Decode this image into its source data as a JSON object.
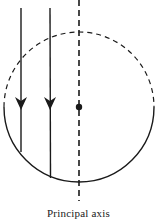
{
  "diagram": {
    "title": "",
    "labels": {
      "principal_axis": "Principal axis"
    },
    "elements": {
      "sphere": {
        "type": "circle",
        "upper_half_style": "dashed",
        "lower_half_style": "solid"
      },
      "incident_rays": [
        {
          "id": "ray-1",
          "direction": "down",
          "arrowhead": true
        },
        {
          "id": "ray-2",
          "direction": "down",
          "arrowhead": true
        }
      ],
      "principal_axis": {
        "style": "dashed",
        "orientation": "vertical"
      },
      "center_point": {
        "type": "dot"
      }
    },
    "colors": {
      "stroke": "#1a1a1a",
      "background": "#ffffff"
    }
  }
}
